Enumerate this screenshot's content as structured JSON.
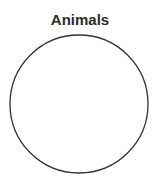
{
  "diagram": {
    "type": "venn",
    "title": "Animals",
    "sets": [
      {
        "label": "Animals",
        "cx": 79,
        "cy": 104,
        "r": 69,
        "stroke": "#333333",
        "fill": "#ffffff"
      }
    ]
  }
}
